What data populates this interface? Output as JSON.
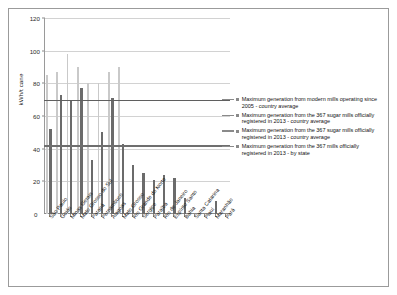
{
  "chart_data": {
    "type": "bar",
    "title": "",
    "subtitle": "",
    "xlabel": "",
    "ylabel": "kWh/t cane",
    "ylim": [
      0,
      120
    ],
    "ytick_values": [
      0,
      20,
      40,
      60,
      80,
      100,
      120
    ],
    "ytick_labels": [
      "0",
      "20",
      "40",
      "60",
      "80",
      "100",
      "120"
    ],
    "grid": true,
    "legend_position": "right",
    "categories": [
      "São Paulo",
      "Goiás",
      "Minas Gerais",
      "Mato Grosso do Sul",
      "Paraná",
      "Pernambuco",
      "Alagoas",
      "Mato Grosso",
      "Rio Grande do Norte",
      "Sergipe",
      "Paraíba",
      "Rio de Janeiro",
      "Espírito Santo",
      "Bahia",
      "Santa Catarina",
      "Piauí",
      "Maranhão",
      "Pará"
    ],
    "series": [
      {
        "name": "Maximum generation from the 367 sugar mills officially registered in 2013 - country average",
        "kind": "bar",
        "color": "#c9c9c9",
        "values": [
          85,
          87,
          98,
          90,
          80,
          80,
          87,
          90,
          0,
          0,
          0,
          0,
          0,
          0,
          0,
          0,
          0,
          0
        ]
      },
      {
        "name": "Maximum generation from the 367 mills officially registered in 2013 - by state",
        "kind": "bar",
        "color": "#6b6b6b",
        "values": [
          52,
          73,
          70,
          77,
          33,
          50,
          71,
          43,
          30,
          25,
          21,
          24,
          22,
          10,
          0,
          0,
          8,
          0
        ]
      }
    ],
    "reference_lines": [
      {
        "name": "Maximum generation from modern mills operating since 2005 - country average",
        "value": 70,
        "color": "#5f5f5f"
      },
      {
        "name": "Maximum generation from the 367 sugar mills officially registered in 2013 - country average",
        "value": 42,
        "color": "#6e6e6e"
      }
    ]
  },
  "legend": {
    "items": [
      {
        "label": "Maximum generation from modern mills operating since 2005 - country average",
        "color": "#8a8a8a",
        "has_line": true
      },
      {
        "label": "Maximum generation from the 367 sugar mills officially registered  in 2013 - country average",
        "color": "#8a8a8a",
        "has_line": true
      },
      {
        "label": "Maximum generation from the 367 sugar mills officially registered  in 2013 - country average",
        "color": "#8a8a8a",
        "has_line": true
      },
      {
        "label": "Maximum generation from the 367 mills officially registered in 2013 - by state",
        "color": "#8a8a8a",
        "has_line": true
      }
    ]
  }
}
